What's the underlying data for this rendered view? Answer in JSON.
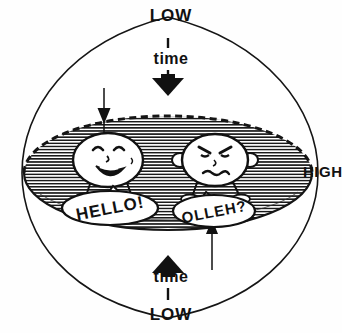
{
  "figure": {
    "background_color": "#fefefe",
    "ink_color": "#111111"
  },
  "labels": {
    "low_top": "LOW",
    "low_bottom": "LOW",
    "time_top": "time",
    "time_bottom": "time",
    "high_right": "HIGH"
  },
  "speech": {
    "left_bubble": "HELLO!",
    "right_bubble": "OLLEH?"
  },
  "characters": {
    "left": {
      "name": "smiling-character",
      "expression": "smiling"
    },
    "right": {
      "name": "frowning-character",
      "expression": "frowning"
    }
  },
  "arrows": {
    "top_time_arrow": "down",
    "bottom_time_arrow": "up",
    "left_thin_arrow": "down",
    "right_thin_arrow": "up"
  },
  "shapes": {
    "outer": "lens",
    "inner": "hatched-ellipse",
    "ellipse_top_edge": "dashed",
    "ellipse_bottom_edge": "solid",
    "ellipse_fill": "horizontal-hatch"
  }
}
